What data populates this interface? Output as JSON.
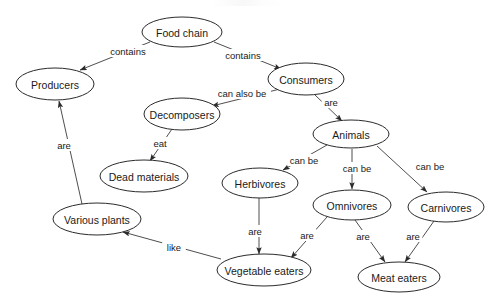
{
  "diagram": {
    "type": "concept-map",
    "width": 496,
    "height": 307,
    "background_color": "#ffffff",
    "node_fill": "#ffffff",
    "node_stroke": "#2b2b2b",
    "edge_color": "#3a3a3a",
    "text_color": "#1a1a1a",
    "nodes": [
      {
        "id": "food-chain",
        "label": "Food chain",
        "cx": 182,
        "cy": 32,
        "rx": 40,
        "ry": 15
      },
      {
        "id": "producers",
        "label": "Producers",
        "cx": 55,
        "cy": 84,
        "rx": 39,
        "ry": 16
      },
      {
        "id": "consumers",
        "label": "Consumers",
        "cx": 306,
        "cy": 79,
        "rx": 38,
        "ry": 16
      },
      {
        "id": "decomposers",
        "label": "Decomposers",
        "cx": 182,
        "cy": 114,
        "rx": 38,
        "ry": 16
      },
      {
        "id": "dead-materials",
        "label": "Dead materials",
        "cx": 144,
        "cy": 176,
        "rx": 44,
        "ry": 16
      },
      {
        "id": "animals",
        "label": "Animals",
        "cx": 351,
        "cy": 134,
        "rx": 38,
        "ry": 14
      },
      {
        "id": "various-plants",
        "label": "Various plants",
        "cx": 97,
        "cy": 219,
        "rx": 44,
        "ry": 16
      },
      {
        "id": "herbivores",
        "label": "Herbivores",
        "cx": 260,
        "cy": 183,
        "rx": 38,
        "ry": 15
      },
      {
        "id": "omnivores",
        "label": "Omnivores",
        "cx": 352,
        "cy": 205,
        "rx": 39,
        "ry": 15
      },
      {
        "id": "carnivores",
        "label": "Carnivores",
        "cx": 446,
        "cy": 207,
        "rx": 38,
        "ry": 15
      },
      {
        "id": "vegetable-eaters",
        "label": "Vegetable eaters",
        "cx": 264,
        "cy": 270,
        "rx": 47,
        "ry": 16
      },
      {
        "id": "meat-eaters",
        "label": "Meat eaters",
        "cx": 399,
        "cy": 277,
        "rx": 41,
        "ry": 15
      }
    ],
    "edges": [
      {
        "id": "e1",
        "from": "food-chain",
        "to": "producers",
        "label": "contains",
        "lx": 128,
        "ly": 51,
        "x1": 150,
        "y1": 42,
        "x2": 80,
        "y2": 70
      },
      {
        "id": "e2",
        "from": "food-chain",
        "to": "consumers",
        "label": "contains",
        "lx": 243,
        "ly": 55,
        "x1": 214,
        "y1": 42,
        "x2": 281,
        "y2": 69
      },
      {
        "id": "e3",
        "from": "consumers",
        "to": "decomposers",
        "label": "can also be",
        "lx": 242,
        "ly": 93,
        "x1": 280,
        "y1": 89,
        "x2": 212,
        "y2": 106
      },
      {
        "id": "e4",
        "from": "consumers",
        "to": "animals",
        "label": "are",
        "lx": 331,
        "ly": 102,
        "x1": 314,
        "y1": 94,
        "x2": 342,
        "y2": 121
      },
      {
        "id": "e5",
        "from": "decomposers",
        "to": "dead-materials",
        "label": "eat",
        "lx": 160,
        "ly": 143,
        "x1": 172,
        "y1": 129,
        "x2": 150,
        "y2": 161
      },
      {
        "id": "e6",
        "from": "various-plants",
        "to": "producers",
        "label": "are",
        "lx": 64,
        "ly": 145,
        "x1": 82,
        "y1": 204,
        "x2": 59,
        "y2": 101
      },
      {
        "id": "e7",
        "from": "animals",
        "to": "herbivores",
        "label": "can be",
        "lx": 304,
        "ly": 160,
        "x1": 327,
        "y1": 145,
        "x2": 283,
        "y2": 170
      },
      {
        "id": "e8",
        "from": "animals",
        "to": "omnivores",
        "label": "can be",
        "lx": 357,
        "ly": 168,
        "x1": 352,
        "y1": 149,
        "x2": 352,
        "y2": 189
      },
      {
        "id": "e9",
        "from": "animals",
        "to": "carnivores",
        "label": "can be",
        "lx": 430,
        "ly": 166,
        "x1": 377,
        "y1": 146,
        "x2": 427,
        "y2": 192
      },
      {
        "id": "e10",
        "from": "herbivores",
        "to": "vegetable-eaters",
        "label": "are",
        "lx": 255,
        "ly": 231,
        "x1": 259,
        "y1": 198,
        "x2": 259,
        "y2": 254
      },
      {
        "id": "e11",
        "from": "omnivores",
        "to": "vegetable-eaters",
        "label": "are",
        "lx": 307,
        "ly": 235,
        "x1": 327,
        "y1": 217,
        "x2": 291,
        "y2": 258
      },
      {
        "id": "e12",
        "from": "omnivores",
        "to": "meat-eaters",
        "label": "are",
        "lx": 363,
        "ly": 236,
        "x1": 355,
        "y1": 220,
        "x2": 385,
        "y2": 262
      },
      {
        "id": "e13",
        "from": "carnivores",
        "to": "meat-eaters",
        "label": "are",
        "lx": 413,
        "ly": 236,
        "x1": 434,
        "y1": 221,
        "x2": 405,
        "y2": 262
      },
      {
        "id": "e14",
        "from": "vegetable-eaters",
        "to": "various-plants",
        "label": "like",
        "lx": 174,
        "ly": 247,
        "x1": 221,
        "y1": 259,
        "x2": 123,
        "y2": 232
      }
    ]
  }
}
